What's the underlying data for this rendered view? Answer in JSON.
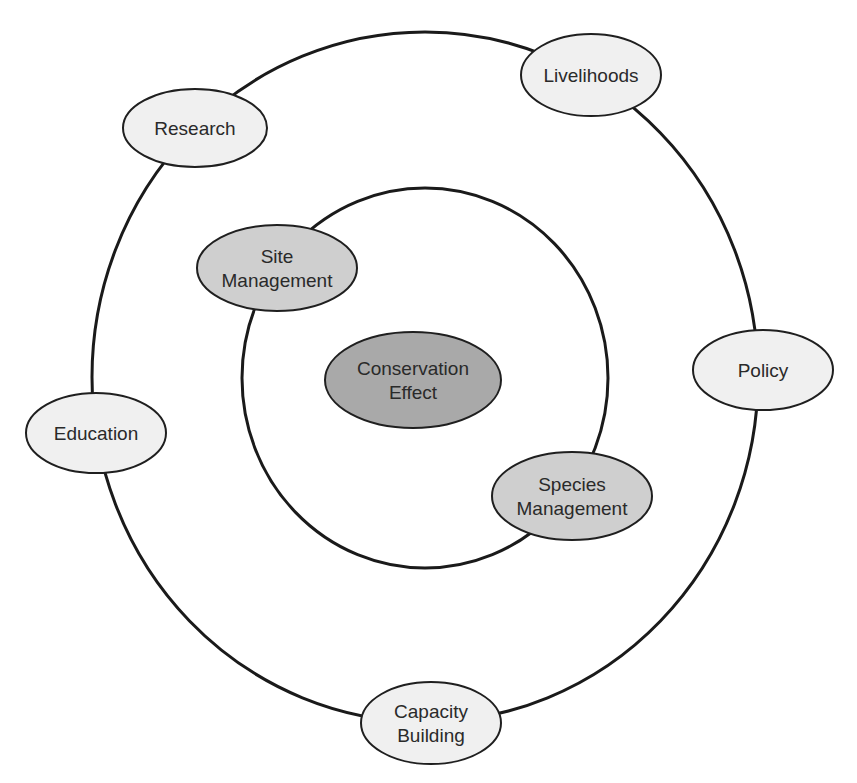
{
  "diagram": {
    "title": "",
    "colors": {
      "background": "#ffffff",
      "line": "#1a1a1a",
      "center_fill": "#a9a9a9",
      "inner_fill": "#cfcfcf",
      "outer_fill": "#f0f0f0",
      "text": "#2a2a2a"
    },
    "rings": [
      {
        "id": "outer-ring",
        "cx": 425,
        "cy": 377,
        "rx": 333,
        "ry": 345
      },
      {
        "id": "inner-ring",
        "cx": 425,
        "cy": 378,
        "rx": 183,
        "ry": 190
      }
    ],
    "center": {
      "id": "conservation-effect",
      "lines": [
        "Conservation",
        "Effect"
      ],
      "cx": 413,
      "cy": 380,
      "rx": 88,
      "ry": 48
    },
    "inner_nodes": [
      {
        "id": "site-management",
        "lines": [
          "Site",
          "Management"
        ],
        "cx": 277,
        "cy": 268,
        "rx": 80,
        "ry": 43
      },
      {
        "id": "species-management",
        "lines": [
          "Species",
          "Management"
        ],
        "cx": 572,
        "cy": 496,
        "rx": 80,
        "ry": 44
      }
    ],
    "outer_nodes": [
      {
        "id": "research",
        "lines": [
          "Research"
        ],
        "cx": 195,
        "cy": 128,
        "rx": 72,
        "ry": 39
      },
      {
        "id": "livelihoods",
        "lines": [
          "Livelihoods"
        ],
        "cx": 591,
        "cy": 75,
        "rx": 70,
        "ry": 41
      },
      {
        "id": "policy",
        "lines": [
          "Policy"
        ],
        "cx": 763,
        "cy": 370,
        "rx": 70,
        "ry": 40
      },
      {
        "id": "education",
        "lines": [
          "Education"
        ],
        "cx": 96,
        "cy": 433,
        "rx": 70,
        "ry": 40
      },
      {
        "id": "capacity-building",
        "lines": [
          "Capacity",
          "Building"
        ],
        "cx": 431,
        "cy": 723,
        "rx": 70,
        "ry": 41
      }
    ]
  }
}
